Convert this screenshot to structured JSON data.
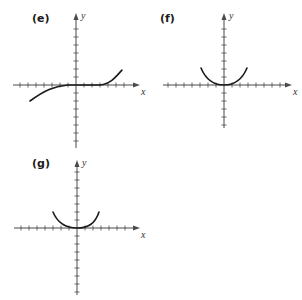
{
  "figure": {
    "panels": [
      {
        "id": "e",
        "label": "(e)",
        "x_axis_label": "x",
        "y_axis_label": "y",
        "curve": "cubic-like, flat near origin, decreasing to lower-left, increasing to upper-right",
        "origin": [
          76,
          85
        ],
        "label_pos": [
          32,
          13
        ],
        "x_range_px": [
          13,
          140
        ],
        "y_range_px": [
          13,
          148
        ],
        "curve_path": "M30,101 C45,90 55,86 68,85 L100,85 C110,84 115,78 122,70"
      },
      {
        "id": "f",
        "label": "(f)",
        "x_axis_label": "x",
        "y_axis_label": "y",
        "curve": "U-shaped, flat bottom at origin",
        "origin": [
          224,
          85
        ],
        "label_pos": [
          160,
          13
        ],
        "x_range_px": [
          163,
          292
        ],
        "y_range_px": [
          13,
          128
        ],
        "curve_path": "M201,68 C206,80 214,85 224,85 C234,85 242,80 247,68"
      },
      {
        "id": "g",
        "label": "(g)",
        "x_axis_label": "x",
        "y_axis_label": "y",
        "curve": "U-shaped, flat bottom at origin",
        "origin": [
          77,
          228
        ],
        "label_pos": [
          32,
          158
        ],
        "x_range_px": [
          14,
          140
        ],
        "y_range_px": [
          160,
          295
        ],
        "curve_path": "M53,212 C58,224 66,228 77,228 C88,228 95,224 99,212"
      }
    ],
    "tick_spacing_px": 8,
    "colors": {
      "axis": "#4a4a4a",
      "curve": "#1a1a1a",
      "label": "#1a1a1a",
      "background": "#ffffff"
    }
  }
}
